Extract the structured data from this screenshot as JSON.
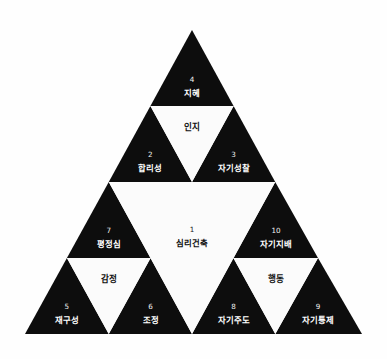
{
  "diagram": {
    "type": "sierpinski-triangle",
    "colors": {
      "background": "#fefefe",
      "fill_dark": "#0d0d0d",
      "fill_light": "#fbfbfb",
      "text_on_dark": "#ffffff",
      "text_on_light": "#111111"
    },
    "center": {
      "number": "1",
      "label": "심리건축"
    },
    "domains": [
      {
        "key": "cognition",
        "label": "인지"
      },
      {
        "key": "emotion",
        "label": "감정"
      },
      {
        "key": "behavior",
        "label": "행동"
      }
    ],
    "nodes": [
      {
        "number": "4",
        "label": "지혜",
        "domain": "인지",
        "position": "apex"
      },
      {
        "number": "2",
        "label": "합리성",
        "domain": "인지",
        "position": "upper-left"
      },
      {
        "number": "3",
        "label": "자기성찰",
        "domain": "인지",
        "position": "upper-right"
      },
      {
        "number": "7",
        "label": "평정심",
        "domain": "감정",
        "position": "mid-left"
      },
      {
        "number": "5",
        "label": "재구성",
        "domain": "감정",
        "position": "bottom-far-left"
      },
      {
        "number": "6",
        "label": "조정",
        "domain": "감정",
        "position": "bottom-left-inner"
      },
      {
        "number": "10",
        "label": "자기지배",
        "domain": "행동",
        "position": "mid-right"
      },
      {
        "number": "8",
        "label": "자기주도",
        "domain": "행동",
        "position": "bottom-right-inner"
      },
      {
        "number": "9",
        "label": "자기통제",
        "domain": "행동",
        "position": "bottom-far-right"
      }
    ]
  }
}
